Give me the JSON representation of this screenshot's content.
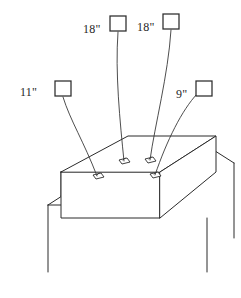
{
  "figure": {
    "line_color": "#2b2b2b",
    "background_color": "#ffffff",
    "sensors": [
      {
        "id": "sensor-left",
        "label": "11\"",
        "label_x": 20,
        "label_y": 96,
        "box_x": 55,
        "box_y": 81,
        "box_w": 16,
        "box_h": 15,
        "wire": "M 63 96 C 70 118, 86 138, 98 169",
        "pad_x": 98,
        "pad_y": 169
      },
      {
        "id": "sensor-center-left",
        "label": "18\"",
        "label_x": 85,
        "label_y": 33,
        "box_x": 110,
        "box_y": 16,
        "box_w": 16,
        "box_h": 15,
        "wire": "M 118 31 C 116 72, 121 118, 124 160",
        "pad_x": 124,
        "pad_y": 160
      },
      {
        "id": "sensor-center-right",
        "label": "18\"",
        "label_x": 138,
        "label_y": 33,
        "box_x": 163,
        "box_y": 14,
        "box_w": 16,
        "box_h": 15,
        "wire": "M 171 29 C 168 74, 155 120, 150 159",
        "pad_x": 150,
        "pad_y": 159
      },
      {
        "id": "sensor-right",
        "label": "9\"",
        "label_x": 176,
        "label_y": 98,
        "box_x": 196,
        "box_y": 81,
        "box_w": 16,
        "box_h": 15,
        "wire": "M 198 93 C 182 108, 166 137, 156 171",
        "pad_x": 156,
        "pad_y": 171
      }
    ],
    "block": {
      "top_face": "M 91 187 L 156 141 L 217 141 L 153 187 Z",
      "front_face": "M 91 187 L 91 215 L 153 215 L 153 187 Z",
      "side_face": "M 153 187 L 217 141 L 217 170 L 153 215 Z"
    },
    "stand": {
      "leg_front_left": "M 79 196 L 79 272",
      "leg_rear_left": "M 91 187 L 91 215",
      "rail_left": "M 79 196 L 91 187",
      "leg_right": "M 225 166 L 225 252",
      "rail_right": "M 217 170 L 232 160",
      "leg_back_right": "M 207 225 L 207 272"
    }
  }
}
